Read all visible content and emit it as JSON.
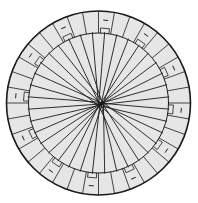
{
  "diagram": {
    "type": "circular-radial-wiring",
    "center": [
      98.5,
      103
    ],
    "outer_radius": 92,
    "inner_radius": 70,
    "hub_center": [
      101,
      104
    ],
    "segment_count": 36,
    "marked_every": 3,
    "mark_glyph": "–",
    "colors": {
      "fill": "#e6e6e6",
      "stroke": "#1a1a1a",
      "background": "#ffffff"
    }
  }
}
